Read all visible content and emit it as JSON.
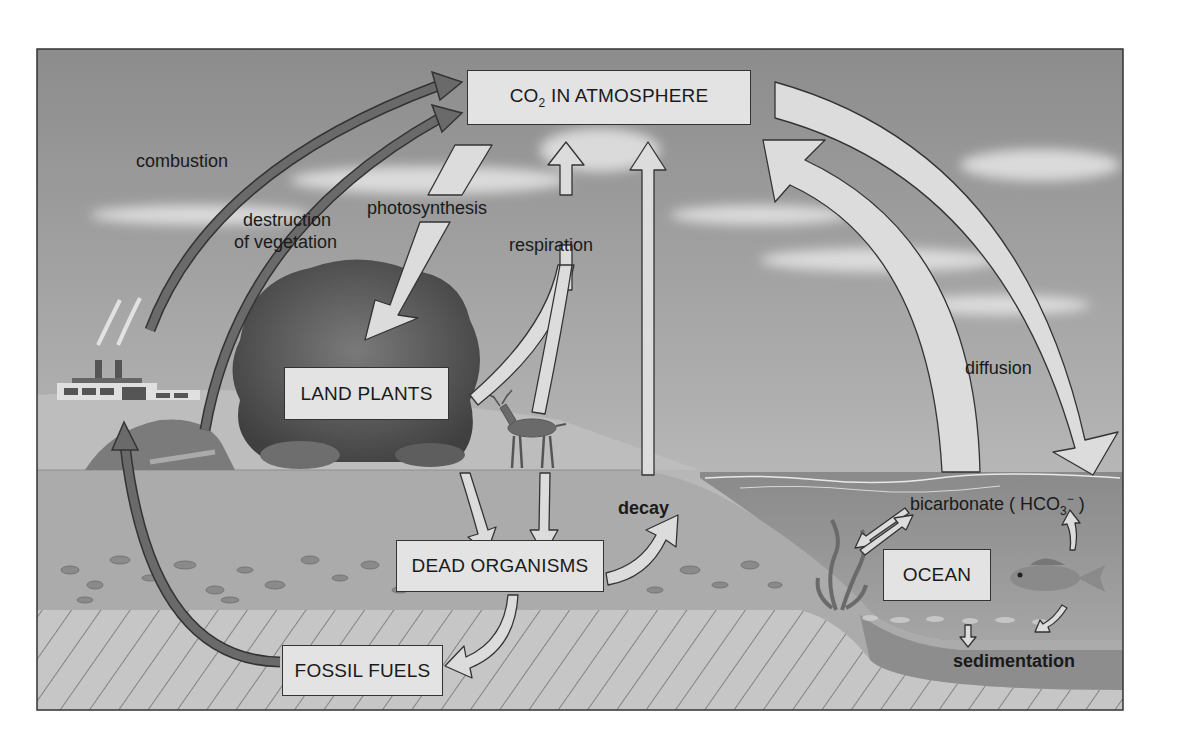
{
  "boxes": {
    "atmosphere": {
      "main": "CO",
      "sub": "2",
      "rest": " IN ATMOSPHERE"
    },
    "land_plants": "LAND PLANTS",
    "dead_organisms": "DEAD ORGANISMS",
    "fossil_fuels": "FOSSIL FUELS",
    "ocean": "OCEAN"
  },
  "labels": {
    "combustion": "combustion",
    "destruction_line1": "destruction",
    "destruction_line2": "of vegetation",
    "photosynthesis": "photosynthesis",
    "respiration": "respiration",
    "diffusion": "diffusion",
    "decay": "decay",
    "bicarbonate_prefix": "bicarbonate ( HCO",
    "bicarbonate_sub": "3",
    "bicarbonate_sup": "−",
    "bicarbonate_suffix": " )",
    "sedimentation": "sedimentation"
  },
  "colors": {
    "sky_top": "#8a8a8a",
    "sky_bottom": "#c8c8c8",
    "ground": "#a9a9a9",
    "ocean": "#8f8f8f",
    "bedrock": "#c4c4c4",
    "dark_arrow": "#666666",
    "light_arrow": "#dcdcdc",
    "box_fill": "#e3e3e3"
  }
}
